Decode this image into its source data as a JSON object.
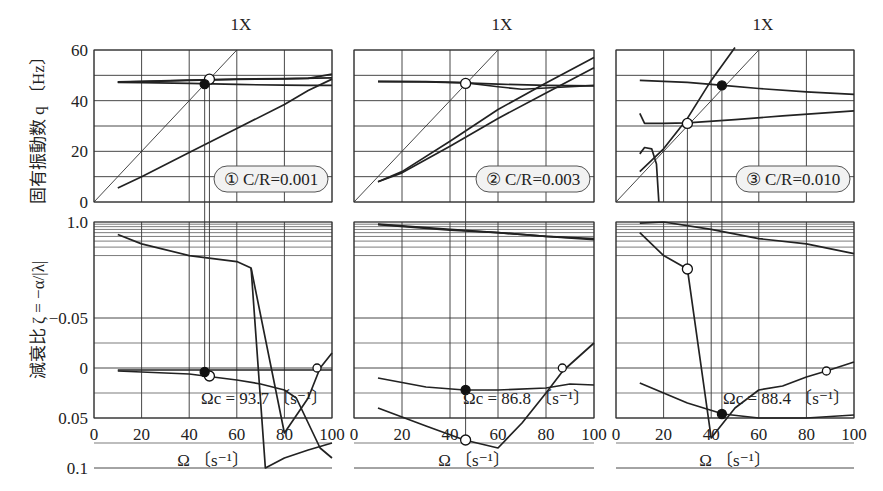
{
  "figure": {
    "y_label_top": "固有振動数  q 〔Hz〕",
    "y_label_bottom": "減衰比  ζ = −α/|λ|",
    "x_label": "Ω 〔s⁻¹〕",
    "x_ticks": [
      "0",
      "20",
      "40",
      "60",
      "80",
      "100"
    ],
    "y_ticks_top": [
      "60",
      "40",
      "20",
      "0"
    ],
    "y_ticks_bottom": [
      "1.0",
      "0.1",
      "0.05",
      "0",
      "−0.05"
    ],
    "sync_line_label": "1X",
    "panels": [
      {
        "badge": "① C/R=0.001",
        "critical_speed": "Ωc = 93.7 〔s⁻¹〕"
      },
      {
        "badge": "② C/R=0.003",
        "critical_speed": "Ωc = 86.8 〔s⁻¹〕"
      },
      {
        "badge": "③ C/R=0.010",
        "critical_speed": "Ωc = 88.4 〔s⁻¹〕"
      }
    ]
  },
  "chart_data": [
    {
      "type": "line",
      "title": "① C/R=0.001",
      "xlabel": "Ω [s^-1]",
      "xlim": [
        0,
        100
      ],
      "subplots": [
        {
          "ylabel": "固有振動数 q [Hz]",
          "ylim": [
            0,
            60
          ],
          "series": [
            {
              "name": "1X",
              "x": [
                0,
                60
              ],
              "y": [
                0,
                60
              ]
            },
            {
              "name": "λ1",
              "x": [
                10,
                20,
                40,
                60,
                80,
                90,
                100
              ],
              "y": [
                47.2,
                47.1,
                46.8,
                46.4,
                46.1,
                46.0,
                46.0
              ]
            },
            {
              "name": "λ2",
              "x": [
                10,
                20,
                40,
                60,
                80,
                90,
                100
              ],
              "y": [
                5.5,
                10,
                19.5,
                29,
                38.5,
                44,
                48.5
              ]
            },
            {
              "name": "λ3",
              "x": [
                10,
                20,
                40,
                60,
                80,
                90,
                100
              ],
              "y": [
                47.3,
                47.5,
                48.0,
                48.4,
                48.6,
                48.8,
                50.5
              ]
            },
            {
              "name": "λ4",
              "x": [
                10,
                20,
                40,
                60,
                80,
                100
              ],
              "y": [
                47.4,
                47.6,
                48.1,
                48.5,
                48.7,
                49.0
              ]
            }
          ],
          "markers": [
            {
              "type": "open",
              "x": 48.5,
              "y": 48.5
            },
            {
              "type": "filled",
              "x": 46.5,
              "y": 46.5
            }
          ]
        },
        {
          "ylabel": "減衰比 ζ = -α/|λ|",
          "ytick_labels": [
            "1.0",
            "0.1",
            "0.05",
            "0",
            "-0.05"
          ],
          "yscale": "log above 0.1, linear below",
          "series": [
            {
              "name": "λ1",
              "x": [
                10,
                20,
                40,
                60,
                66,
                80,
                90,
                95,
                100
              ],
              "y": [
                0.55,
                0.35,
                0.2,
                0.15,
                0.11,
                0.065,
                0.03,
                0.0,
                -0.015
              ]
            },
            {
              "name": "λ2",
              "x": [
                66,
                72,
                80,
                90,
                100
              ],
              "y": [
                0.11,
                0.1,
                0.09,
                0.082,
                0.075
              ]
            },
            {
              "name": "λ3",
              "x": [
                10,
                40,
                50,
                60,
                70,
                80,
                85,
                90,
                95,
                100
              ],
              "y": [
                0.003,
                0.006,
                0.009,
                0.012,
                0.016,
                0.022,
                0.03,
                0.055,
                0.08,
                0.09
              ]
            },
            {
              "name": "λ4",
              "x": [
                10,
                40,
                60,
                80,
                100
              ],
              "y": [
                0.002,
                0.002,
                0.002,
                0.002,
                0.002
              ]
            }
          ],
          "markers": [
            {
              "type": "open",
              "x": 48.5,
              "y": 0.008
            },
            {
              "type": "filled",
              "x": 46.5,
              "y": 0.004
            },
            {
              "type": "open",
              "x": 93.7,
              "y": 0.0
            }
          ],
          "annotation": "Ωc = 93.7 [s^-1]"
        }
      ]
    },
    {
      "type": "line",
      "title": "② C/R=0.003",
      "xlabel": "Ω [s^-1]",
      "xlim": [
        0,
        100
      ],
      "subplots": [
        {
          "ylabel": "固有振動数 q [Hz]",
          "ylim": [
            0,
            60
          ],
          "series": [
            {
              "name": "1X",
              "x": [
                0,
                60
              ],
              "y": [
                0,
                60
              ]
            },
            {
              "name": "λ1",
              "x": [
                10,
                20,
                40,
                60,
                80,
                100
              ],
              "y": [
                8,
                12,
                24,
                36.5,
                47,
                57
              ]
            },
            {
              "name": "λ2",
              "x": [
                10,
                20,
                40,
                60,
                80,
                100
              ],
              "y": [
                8,
                11.5,
                22,
                33,
                43,
                53
              ]
            },
            {
              "name": "λ3",
              "x": [
                10,
                30,
                46,
                60,
                80,
                100
              ],
              "y": [
                47.5,
                47.4,
                47.0,
                46.5,
                46.0,
                45.8
              ]
            },
            {
              "name": "λ4",
              "x": [
                10,
                30,
                46,
                60,
                70,
                80,
                100
              ],
              "y": [
                47.6,
                47.5,
                47.1,
                45.5,
                44.5,
                45,
                46
              ]
            }
          ],
          "markers": [
            {
              "type": "open",
              "x": 46.5,
              "y": 46.8
            }
          ]
        },
        {
          "ylabel": "減衰比 ζ = -α/|λ|",
          "ytick_labels": [
            "1.0",
            "0.1",
            "0.05",
            "0",
            "-0.05"
          ],
          "series": [
            {
              "name": "λ1",
              "x": [
                10,
                40,
                60,
                80,
                100
              ],
              "y": [
                0.9,
                0.7,
                0.6,
                0.5,
                0.45
              ]
            },
            {
              "name": "λ2",
              "x": [
                10,
                40,
                60,
                80,
                100
              ],
              "y": [
                0.88,
                0.68,
                0.6,
                0.5,
                0.43
              ]
            },
            {
              "name": "λ3",
              "x": [
                10,
                30,
                46,
                60,
                70,
                80,
                87,
                100
              ],
              "y": [
                0.04,
                0.058,
                0.072,
                0.08,
                0.055,
                0.025,
                0.003,
                -0.025
              ]
            },
            {
              "name": "λ4",
              "x": [
                10,
                30,
                46,
                60,
                80,
                90,
                100
              ],
              "y": [
                0.01,
                0.019,
                0.022,
                0.022,
                0.02,
                0.016,
                0.017
              ]
            }
          ],
          "markers": [
            {
              "type": "open",
              "x": 46.5,
              "y": 0.072
            },
            {
              "type": "filled",
              "x": 46.5,
              "y": 0.022
            },
            {
              "type": "open",
              "x": 86.8,
              "y": 0.0
            }
          ],
          "annotation": "Ωc = 86.8 [s^-1]"
        }
      ]
    },
    {
      "type": "line",
      "title": "③ C/R=0.010",
      "xlabel": "Ω [s^-1]",
      "xlim": [
        0,
        100
      ],
      "subplots": [
        {
          "ylabel": "固有振動数 q [Hz]",
          "ylim": [
            0,
            60
          ],
          "series": [
            {
              "name": "1X",
              "x": [
                0,
                60
              ],
              "y": [
                0,
                60
              ]
            },
            {
              "name": "λ1",
              "x": [
                10,
                12,
                15,
                17,
                18
              ],
              "y": [
                19,
                21.5,
                21,
                15,
                0
              ]
            },
            {
              "name": "λ2",
              "x": [
                10,
                20,
                30,
                40,
                50
              ],
              "y": [
                12,
                21,
                33,
                48,
                61
              ]
            },
            {
              "name": "λ3",
              "x": [
                10,
                12,
                20,
                30,
                50,
                70,
                100
              ],
              "y": [
                35,
                31,
                31,
                31.2,
                32.5,
                34,
                36
              ]
            },
            {
              "name": "λ4",
              "x": [
                10,
                30,
                45,
                60,
                80,
                100
              ],
              "y": [
                48,
                47.2,
                46,
                44.8,
                43.5,
                42.5
              ]
            }
          ],
          "markers": [
            {
              "type": "open",
              "x": 30,
              "y": 31
            },
            {
              "type": "filled",
              "x": 44.5,
              "y": 46
            }
          ]
        },
        {
          "ylabel": "減衰比 ζ = -α/|λ|",
          "ytick_labels": [
            "1.0",
            "0.1",
            "0.05",
            "0",
            "-0.05"
          ],
          "series": [
            {
              "name": "λ2",
              "x": [
                10,
                20,
                40,
                60,
                80,
                100
              ],
              "y": [
                0.95,
                1.0,
                0.7,
                0.45,
                0.35,
                0.22
              ]
            },
            {
              "name": "λ3",
              "x": [
                10,
                20,
                30,
                40,
                50,
                60,
                70,
                80,
                88.4,
                100
              ],
              "y": [
                0.6,
                0.2,
                0.105,
                0.07,
                0.04,
                0.022,
                0.018,
                0.009,
                0.003,
                -0.006
              ]
            },
            {
              "name": "λ4",
              "x": [
                10,
                20,
                30,
                45,
                60,
                80,
                100
              ],
              "y": [
                0.015,
                0.025,
                0.035,
                0.046,
                0.05,
                0.05,
                0.047
              ]
            }
          ],
          "markers": [
            {
              "type": "open",
              "x": 30,
              "y": 0.105
            },
            {
              "type": "filled",
              "x": 44.5,
              "y": 0.046
            },
            {
              "type": "open",
              "x": 88.4,
              "y": 0.003
            }
          ],
          "annotation": "Ωc = 88.4 [s^-1]"
        }
      ]
    }
  ]
}
